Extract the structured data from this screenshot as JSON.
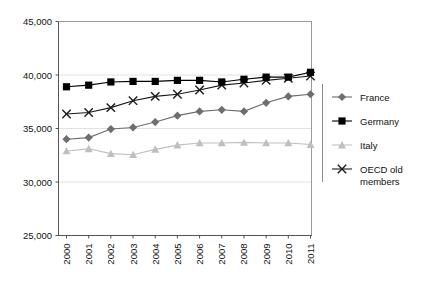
{
  "chart_data": {
    "type": "line",
    "title": "",
    "subtitle": "",
    "xlabel": "",
    "ylabel": "",
    "categories": [
      "2000",
      "2001",
      "2002",
      "2003",
      "2004",
      "2005",
      "2006",
      "2007",
      "2008",
      "2009",
      "2010",
      "2011"
    ],
    "x": [
      2000,
      2001,
      2002,
      2003,
      2004,
      2005,
      2006,
      2007,
      2008,
      2009,
      2010,
      2011
    ],
    "ylim": [
      25000,
      45000
    ],
    "ytick_labels": [
      "45,000",
      "40,000",
      "35,000",
      "30,000",
      "25,000"
    ],
    "ytick_values": [
      45000,
      40000,
      35000,
      30000,
      25000
    ],
    "ytick_step": 5000,
    "grid": "horizontal",
    "legend_position": "right",
    "series": [
      {
        "name": "France",
        "marker": "diamond",
        "color": "#6e6e6e",
        "values": [
          34000,
          34150,
          34950,
          35100,
          35600,
          36200,
          36600,
          36750,
          36600,
          37400,
          38000,
          38200
        ]
      },
      {
        "name": "Germany",
        "marker": "square",
        "color": "#000000",
        "values": [
          38900,
          39050,
          39350,
          39400,
          39400,
          39500,
          39500,
          39350,
          39600,
          39800,
          39800,
          40250
        ]
      },
      {
        "name": "Italy",
        "marker": "triangle",
        "color": "#bfbfbf",
        "values": [
          32900,
          33100,
          32650,
          32550,
          33050,
          33450,
          33650,
          33650,
          33700,
          33650,
          33650,
          33500
        ]
      },
      {
        "name": "OECD old members",
        "marker": "cross-x",
        "color": "#1a1a1a",
        "values": [
          36350,
          36500,
          36950,
          37600,
          38000,
          38200,
          38600,
          39050,
          39250,
          39500,
          39700,
          39900
        ]
      }
    ]
  },
  "legend": {
    "items": [
      {
        "label": "France"
      },
      {
        "label": "Germany"
      },
      {
        "label": "Italy"
      },
      {
        "label": "OECD old",
        "label2": "members"
      }
    ]
  },
  "colors": {
    "france": "#6e6e6e",
    "germany": "#000000",
    "italy": "#bfbfbf",
    "oecd": "#1a1a1a",
    "axis": "#555555",
    "grid": "#e2e2e2",
    "text": "#111111"
  }
}
